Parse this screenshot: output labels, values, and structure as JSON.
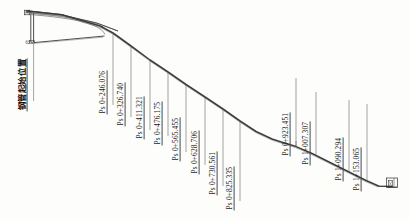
{
  "drawing": {
    "type": "penstock-longitudinal-profile",
    "start_label": {
      "text": "钢管起始位置",
      "meaning": "steel-pipe-start-position"
    },
    "stations": [
      {
        "label": "Ps 0+246.076",
        "x": 246.076
      },
      {
        "label": "Ps 0+326.740",
        "x": 326.74
      },
      {
        "label": "Ps 0+411.321",
        "x": 411.321
      },
      {
        "label": "Ps 0+476.175",
        "x": 476.175
      },
      {
        "label": "Ps 0+565.455",
        "x": 565.455
      },
      {
        "label": "Ps 0+628.706",
        "x": 628.706
      },
      {
        "label": "Ps 0+730.561",
        "x": 730.561
      },
      {
        "label": "Ps 0+825.335",
        "x": 825.335
      },
      {
        "label": "Ps 0+923.451",
        "x": 923.451
      },
      {
        "label": "Ps 1+007.307",
        "x": 1007.307
      },
      {
        "label": "Ps 1+090.294",
        "x": 1090.294
      },
      {
        "label": "Ps 1+153.065",
        "x": 1153.065
      }
    ],
    "colors": {
      "line": "#3a3a3a",
      "label_text": "#1b1b1b",
      "leader": "#4a4a4a",
      "background": "#fdfdfc"
    }
  }
}
